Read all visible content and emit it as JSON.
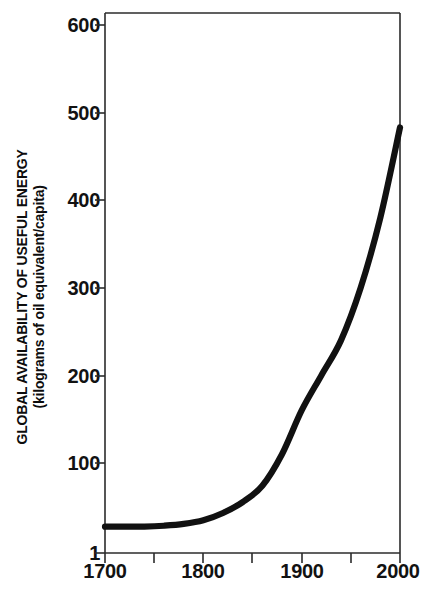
{
  "chart_data": {
    "type": "line",
    "title": "",
    "xlabel": "",
    "ylabel": "GLOBAL AVAILABILITY OF USEFUL ENERGY",
    "ylabel_sub": "(kilograms of oil equivalent/capita)",
    "xlim": [
      1700,
      2000
    ],
    "ylim": [
      1,
      600
    ],
    "grid": false,
    "legend": null,
    "x_ticks": [
      1700,
      1800,
      1900,
      2000
    ],
    "x_tick_labels": [
      "1700",
      "1800",
      "1900",
      "2000"
    ],
    "x_minor_ticks": [
      1750,
      1850,
      1950
    ],
    "y_ticks": [
      1,
      100,
      200,
      300,
      400,
      500,
      600
    ],
    "y_tick_labels": [
      "1",
      "100",
      "200",
      "300",
      "400",
      "500",
      "600"
    ],
    "series": [
      {
        "name": "Global availability of useful energy",
        "x": [
          1700,
          1720,
          1740,
          1760,
          1780,
          1800,
          1820,
          1840,
          1860,
          1880,
          1900,
          1920,
          1940,
          1960,
          1980,
          2000
        ],
        "values": [
          30,
          30,
          30,
          31,
          33,
          37,
          45,
          57,
          75,
          110,
          160,
          200,
          240,
          300,
          380,
          483
        ]
      }
    ],
    "colors": {
      "curve": "#111111",
      "axis": "#2b2b2b",
      "text": "#121212",
      "background": "#ffffff"
    }
  },
  "axis": {
    "y_labels": [
      "600",
      "500",
      "400",
      "300",
      "200",
      "100",
      "1"
    ],
    "x_labels": [
      "1700",
      "1800",
      "1900",
      "2000"
    ],
    "ylabel_main": "GLOBAL AVAILABILITY OF USEFUL ENERGY",
    "ylabel_sub": "(kilograms of oil equivalent/capita)"
  }
}
